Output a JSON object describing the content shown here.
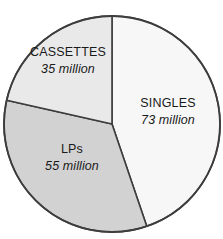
{
  "chart_data": {
    "type": "pie",
    "title": "",
    "subtitle": "",
    "xlabel": "",
    "ylabel": "",
    "unit": "million",
    "total": 163,
    "legend_position": "none",
    "grid": false,
    "start_angle_deg": 0,
    "direction": "clockwise",
    "categories": [
      "SINGLES",
      "LPs",
      "CASSETTES"
    ],
    "values": [
      73,
      55,
      35
    ],
    "slices": [
      {
        "label": "SINGLES",
        "value": 73,
        "value_text": "73 million",
        "color": "#f7f7f7",
        "stroke": "#3d3d3d",
        "percent": 44.8,
        "angle_deg": 161.2
      },
      {
        "label": "LPs",
        "value": 55,
        "value_text": "55 million",
        "color": "#d2d2d2",
        "stroke": "#3d3d3d",
        "percent": 33.7,
        "angle_deg": 121.5
      },
      {
        "label": "CASSETTES",
        "value": 35,
        "value_text": "35 million",
        "color": "#e9e9e9",
        "stroke": "#3d3d3d",
        "percent": 21.5,
        "angle_deg": 77.3
      }
    ],
    "colors": {
      "singles_fill": "#f7f7f7",
      "lps_fill": "#d2d2d2",
      "cassettes_fill": "#e9e9e9",
      "outline": "#3d3d3d",
      "text": "#1a1a1a",
      "background": "#ffffff"
    }
  }
}
